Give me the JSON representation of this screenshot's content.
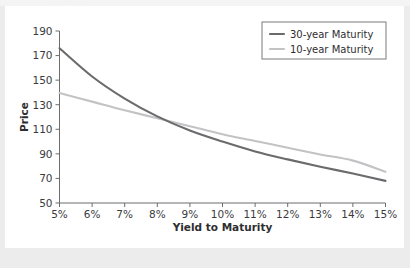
{
  "figure": {
    "background_color": "#ececed",
    "panel_color": "#ffffff",
    "top_fragment_text": "..........."
  },
  "chart_data": {
    "type": "line",
    "title": "",
    "xlabel": "Yield to Maturity",
    "ylabel": "Price",
    "xlim": [
      5,
      15
    ],
    "ylim": [
      50,
      190
    ],
    "xticks": [
      5,
      6,
      7,
      8,
      9,
      10,
      11,
      12,
      13,
      14,
      15
    ],
    "xticklabels": [
      "5%",
      "6%",
      "7%",
      "8%",
      "9%",
      "10%",
      "11%",
      "12%",
      "13%",
      "14%",
      "15%"
    ],
    "yticks": [
      50,
      70,
      90,
      110,
      130,
      150,
      170,
      190
    ],
    "yticklabels": [
      "50",
      "70",
      "90",
      "110",
      "130",
      "150",
      "170",
      "190"
    ],
    "grid": false,
    "legend_position": "upper right",
    "x": [
      5,
      6,
      7,
      8,
      9,
      10,
      11,
      12,
      13,
      14,
      15
    ],
    "series": [
      {
        "name": "30-year Maturity",
        "color": "#6b6b6e",
        "values": [
          176.0,
          153.0,
          135.0,
          120.5,
          109.0,
          100.0,
          92.0,
          85.5,
          79.5,
          74.0,
          68.0
        ]
      },
      {
        "name": "10-year Maturity",
        "color": "#c3c3c6",
        "values": [
          139.5,
          132.5,
          125.5,
          119.0,
          112.5,
          106.0,
          100.5,
          95.0,
          89.5,
          84.5,
          75.5
        ]
      }
    ]
  },
  "legend": {
    "entries": [
      {
        "label": "30-year Maturity",
        "color": "#6b6b6e"
      },
      {
        "label": "10-year Maturity",
        "color": "#c3c3c6"
      }
    ]
  }
}
